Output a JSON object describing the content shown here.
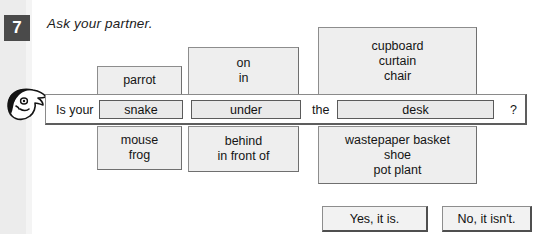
{
  "exercise": {
    "number": "7",
    "instruction": "Ask your partner."
  },
  "icons": {
    "speaker_head": "speaking-head-icon"
  },
  "substitution_table": {
    "columns": [
      {
        "id": "noun",
        "above": {
          "lines": [
            "parrot"
          ]
        },
        "slot": "snake",
        "below": {
          "lines": [
            "mouse",
            "frog"
          ]
        }
      },
      {
        "id": "preposition",
        "above": {
          "lines": [
            "on",
            "in"
          ]
        },
        "slot": "under",
        "below": {
          "lines": [
            "behind",
            "in front of"
          ]
        }
      },
      {
        "id": "object",
        "above": {
          "lines": [
            "cupboard",
            "curtain",
            "chair"
          ]
        },
        "slot": "desk",
        "below": {
          "lines": [
            "wastepaper basket",
            "shoe",
            "pot plant"
          ]
        }
      }
    ],
    "sentence": {
      "lead": "Is your",
      "article": "the",
      "terminator": "?"
    }
  },
  "answers": [
    {
      "label": "Yes, it is."
    },
    {
      "label": "No, it isn't."
    }
  ],
  "colors": {
    "number_chip_bg": "#4a4a4a",
    "option_box_bg": "#eeeeee",
    "slot_bg": "#e9e9e9",
    "border": "#8d8d8d",
    "text": "#151515"
  }
}
